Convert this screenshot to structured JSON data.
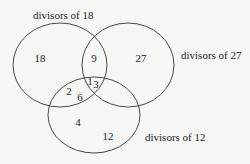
{
  "diagram": {
    "type": "venn",
    "sets": [
      {
        "id": "A",
        "label": "divisors of 18"
      },
      {
        "id": "B",
        "label": "divisors of 27"
      },
      {
        "id": "C",
        "label": "divisors of 12"
      }
    ],
    "regions": {
      "A_only": "18",
      "B_only": "27",
      "A_and_B_only": "9",
      "A_and_C_only_1": "2",
      "A_and_C_only_2": "6",
      "A_B_C_1": "1",
      "A_B_C_2": "3",
      "C_only_1": "4",
      "C_only_2": "12"
    },
    "colors": {
      "background": "#f6f6f4",
      "stroke": "#333333"
    }
  }
}
